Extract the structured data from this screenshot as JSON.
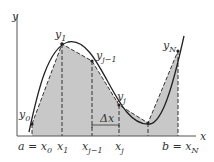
{
  "axes": {
    "x_label": "x",
    "y_label": "y"
  },
  "x_ticks": [
    {
      "base": "a = x",
      "sub": "0"
    },
    {
      "base": "x",
      "sub": "1"
    },
    {
      "base": "x",
      "sub": "j−1"
    },
    {
      "base": "x",
      "sub": "j"
    },
    {
      "base": "b = x",
      "sub": "N"
    }
  ],
  "point_labels": [
    {
      "base": "y",
      "sub": "0"
    },
    {
      "base": "y",
      "sub": "1"
    },
    {
      "base": "y",
      "sub": "j−1"
    },
    {
      "base": "y",
      "sub": "j"
    },
    {
      "base": "y",
      "sub": "N"
    }
  ],
  "delta_label": "Δx",
  "colors": {
    "fill": "#c8c8c8",
    "line": "#333333",
    "axis": "#555555"
  }
}
